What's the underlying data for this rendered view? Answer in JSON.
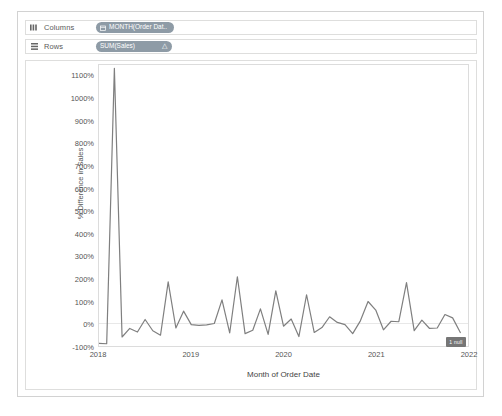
{
  "shelves": {
    "columns": {
      "label": "Columns",
      "icon": "columns-shelf-icon",
      "pill": {
        "text": "MONTH(Order Dat..",
        "glyph": "calendar-icon"
      }
    },
    "rows": {
      "label": "Rows",
      "icon": "rows-shelf-icon",
      "pill": {
        "text": "SUM(Sales)",
        "delta": "△"
      }
    }
  },
  "annotations": {
    "null_badge": "1 null"
  },
  "colors": {
    "pill": "#8e9ba6",
    "line": "#7f7f7f",
    "axis_text": "#555555",
    "frame": "#dcdcdc",
    "zero_line": "#e8e8e8"
  },
  "chart_data": {
    "type": "line",
    "title": "",
    "xlabel": "Month of Order Date",
    "ylabel": "% Difference in Sales",
    "ylim": [
      -100,
      1150
    ],
    "ytick_values": [
      1100,
      1000,
      900,
      800,
      700,
      600,
      500,
      400,
      300,
      200,
      100,
      0,
      -100
    ],
    "ytick_labels": [
      "1100%",
      "1000%",
      "900%",
      "800%",
      "700%",
      "600%",
      "500%",
      "400%",
      "300%",
      "200%",
      "100%",
      "0%",
      "-100%"
    ],
    "xtick_labels": [
      "2018",
      "2019",
      "2020",
      "2021",
      "2022"
    ],
    "xtick_positions": [
      0,
      12,
      24,
      36,
      48
    ],
    "xlim": [
      0,
      48
    ],
    "grid": false,
    "legend": null,
    "series": [
      {
        "name": "% Difference in Sales",
        "x": [
          0,
          1,
          2,
          3,
          4,
          5,
          6,
          7,
          8,
          9,
          10,
          11,
          12,
          13,
          14,
          15,
          16,
          17,
          18,
          19,
          20,
          21,
          22,
          23,
          24,
          25,
          26,
          27,
          28,
          29,
          30,
          31,
          32,
          33,
          34,
          35,
          36,
          37,
          38,
          39,
          40,
          41,
          42,
          43,
          44,
          45,
          46,
          47
        ],
        "values": [
          -88,
          -90,
          1135,
          -60,
          -22,
          -38,
          18,
          -32,
          -52,
          185,
          -20,
          55,
          -5,
          -8,
          -6,
          0,
          105,
          -42,
          208,
          -45,
          -30,
          65,
          -48,
          145,
          -12,
          20,
          -58,
          128,
          -40,
          -18,
          30,
          5,
          -5,
          -45,
          12,
          98,
          60,
          -28,
          10,
          8,
          182,
          -32,
          15,
          -22,
          -20,
          40,
          25,
          -40
        ]
      }
    ]
  }
}
